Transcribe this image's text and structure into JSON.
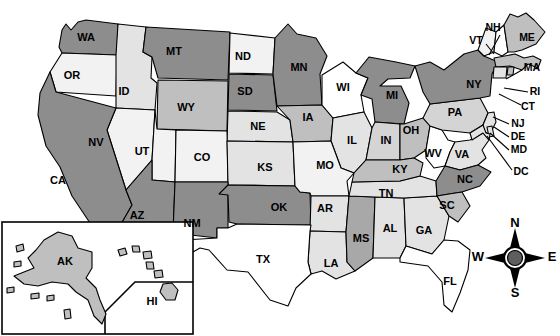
{
  "map": {
    "title": "United States Map with State Abbreviations",
    "palette": {
      "white": "#ffffff",
      "very_light": "#f2f2f2",
      "light": "#e3e3e3",
      "light_medium": "#d4d4d4",
      "medium": "#bfbfbf",
      "medium_dark": "#a8a8a8",
      "dark": "#8d8d8d",
      "outline": "#000000",
      "compass_hub": "#5e5e5e"
    },
    "states": [
      {
        "code": "WA",
        "name": "Washington",
        "shade": "dark",
        "label_x": 86,
        "label_y": 38
      },
      {
        "code": "OR",
        "name": "Oregon",
        "shade": "very_light",
        "label_x": 72,
        "label_y": 76
      },
      {
        "code": "ID",
        "name": "Idaho",
        "shade": "light",
        "label_x": 124,
        "label_y": 92
      },
      {
        "code": "MT",
        "name": "Montana",
        "shade": "dark",
        "label_x": 174,
        "label_y": 52
      },
      {
        "code": "WY",
        "name": "Wyoming",
        "shade": "medium",
        "label_x": 186,
        "label_y": 108
      },
      {
        "code": "ND",
        "name": "North Dakota",
        "shade": "very_light",
        "label_x": 243,
        "label_y": 57
      },
      {
        "code": "SD",
        "name": "South Dakota",
        "shade": "dark",
        "label_x": 245,
        "label_y": 92
      },
      {
        "code": "NE",
        "name": "Nebraska",
        "shade": "light",
        "label_x": 258,
        "label_y": 127
      },
      {
        "code": "MN",
        "name": "Minnesota",
        "shade": "dark",
        "label_x": 299,
        "label_y": 68
      },
      {
        "code": "IA",
        "name": "Iowa",
        "shade": "medium",
        "label_x": 308,
        "label_y": 118
      },
      {
        "code": "WI",
        "name": "Wisconsin",
        "shade": "white",
        "label_x": 343,
        "label_y": 88
      },
      {
        "code": "MI",
        "name": "Michigan",
        "shade": "dark",
        "label_x": 392,
        "label_y": 96
      },
      {
        "code": "NV",
        "name": "Nevada",
        "shade": "very_light",
        "label_x": 96,
        "label_y": 143
      },
      {
        "code": "UT",
        "name": "Utah",
        "shade": "very_light",
        "label_x": 142,
        "label_y": 152
      },
      {
        "code": "CO",
        "name": "Colorado",
        "shade": "very_light",
        "label_x": 202,
        "label_y": 158
      },
      {
        "code": "KS",
        "name": "Kansas",
        "shade": "light",
        "label_x": 265,
        "label_y": 168
      },
      {
        "code": "IL",
        "name": "Illinois",
        "shade": "light",
        "label_x": 352,
        "label_y": 141
      },
      {
        "code": "IN",
        "name": "Indiana",
        "shade": "light_medium",
        "label_x": 386,
        "label_y": 141
      },
      {
        "code": "OH",
        "name": "Ohio",
        "shade": "medium",
        "label_x": 411,
        "label_y": 131
      },
      {
        "code": "PA",
        "name": "Pennsylvania",
        "shade": "light_medium",
        "label_x": 455,
        "label_y": 113
      },
      {
        "code": "NY",
        "name": "New York",
        "shade": "dark",
        "label_x": 474,
        "label_y": 85
      },
      {
        "code": "CA",
        "name": "California",
        "shade": "dark",
        "label_x": 58,
        "label_y": 181
      },
      {
        "code": "AZ",
        "name": "Arizona",
        "shade": "dark",
        "label_x": 137,
        "label_y": 216
      },
      {
        "code": "NM",
        "name": "New Mexico",
        "shade": "dark",
        "label_x": 192,
        "label_y": 224
      },
      {
        "code": "OK",
        "name": "Oklahoma",
        "shade": "dark",
        "label_x": 279,
        "label_y": 208
      },
      {
        "code": "MO",
        "name": "Missouri",
        "shade": "very_light",
        "label_x": 325,
        "label_y": 166
      },
      {
        "code": "AR",
        "name": "Arkansas",
        "shade": "light",
        "label_x": 325,
        "label_y": 209
      },
      {
        "code": "KY",
        "name": "Kentucky",
        "shade": "medium",
        "label_x": 400,
        "label_y": 170
      },
      {
        "code": "TN",
        "name": "Tennessee",
        "shade": "light",
        "label_x": 386,
        "label_y": 194
      },
      {
        "code": "WV",
        "name": "West Virginia",
        "shade": "white",
        "label_x": 433,
        "label_y": 154
      },
      {
        "code": "VA",
        "name": "Virginia",
        "shade": "light",
        "label_x": 462,
        "label_y": 155
      },
      {
        "code": "NC",
        "name": "North Carolina",
        "shade": "dark",
        "label_x": 465,
        "label_y": 180
      },
      {
        "code": "SC",
        "name": "South Carolina",
        "shade": "medium",
        "label_x": 447,
        "label_y": 206
      },
      {
        "code": "GA",
        "name": "Georgia",
        "shade": "light",
        "label_x": 424,
        "label_y": 231
      },
      {
        "code": "AL",
        "name": "Alabama",
        "shade": "light",
        "label_x": 390,
        "label_y": 229
      },
      {
        "code": "MS",
        "name": "Mississippi",
        "shade": "medium_dark",
        "label_x": 361,
        "label_y": 239
      },
      {
        "code": "LA",
        "name": "Louisiana",
        "shade": "light",
        "label_x": 331,
        "label_y": 264
      },
      {
        "code": "TX",
        "name": "Texas",
        "shade": "white",
        "label_x": 263,
        "label_y": 260
      },
      {
        "code": "FL",
        "name": "Florida",
        "shade": "white",
        "label_x": 450,
        "label_y": 282
      },
      {
        "code": "ME",
        "name": "Maine",
        "shade": "medium",
        "label_x": 527,
        "label_y": 38
      },
      {
        "code": "VT",
        "name": "Vermont",
        "shade": "very_light",
        "label_x": 476,
        "label_y": 41
      },
      {
        "code": "NH",
        "name": "New Hampshire",
        "shade": "white",
        "label_x": 493,
        "label_y": 28
      },
      {
        "code": "MA",
        "name": "Massachusetts",
        "shade": "medium",
        "label_x": 532,
        "label_y": 68
      },
      {
        "code": "RI",
        "name": "Rhode Island",
        "shade": "medium",
        "label_x": 535,
        "label_y": 92
      },
      {
        "code": "CT",
        "name": "Connecticut",
        "shade": "light",
        "label_x": 528,
        "label_y": 107
      },
      {
        "code": "NJ",
        "name": "New Jersey",
        "shade": "light",
        "label_x": 518,
        "label_y": 124
      },
      {
        "code": "DE",
        "name": "Delaware",
        "shade": "light",
        "label_x": 518,
        "label_y": 137
      },
      {
        "code": "MD",
        "name": "Maryland",
        "shade": "light",
        "label_x": 519,
        "label_y": 150
      },
      {
        "code": "DC",
        "name": "District of Columbia",
        "shade": "white",
        "label_x": 521,
        "label_y": 172
      },
      {
        "code": "AK",
        "name": "Alaska",
        "shade": "medium",
        "label_x": 65,
        "label_y": 262
      },
      {
        "code": "HI",
        "name": "Hawaii",
        "shade": "light",
        "label_x": 152,
        "label_y": 302
      }
    ],
    "leader_lines": [
      {
        "for": "NH",
        "points": "500,35 489,55"
      },
      {
        "for": "VT",
        "points": "486,44 494,54"
      },
      {
        "for": "MA",
        "points": "522,70 506,79"
      },
      {
        "for": "RI",
        "points": "528,92 504,88"
      },
      {
        "for": "CT",
        "points": "521,105 499,94"
      },
      {
        "for": "NJ",
        "points": "509,124 493,117"
      },
      {
        "for": "DE",
        "points": "509,137 494,127"
      },
      {
        "for": "MD",
        "points": "509,150 490,133"
      },
      {
        "for": "DC",
        "points": "512,170 487,136"
      }
    ],
    "inset": {
      "name": "alaska-hawaii-inset",
      "box": {
        "x": 2,
        "y": 222,
        "width": 191,
        "height": 112
      },
      "divider": "105,334 105,312 135,282 193,282"
    },
    "compass": {
      "name": "compass-rose",
      "center_x": 515,
      "center_y": 260,
      "north": "N",
      "south": "S",
      "east": "E",
      "west": "W"
    }
  }
}
